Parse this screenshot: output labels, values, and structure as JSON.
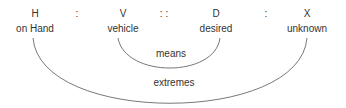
{
  "proportion": {
    "terms": [
      {
        "symbol": "H",
        "label": "on Hand",
        "x": 35
      },
      {
        "symbol": "V",
        "label": "vehicle",
        "x": 123
      },
      {
        "symbol": "D",
        "label": "desired",
        "x": 216
      },
      {
        "symbol": "X",
        "label": "unknown",
        "x": 307
      }
    ],
    "separators": [
      {
        "text": ":",
        "x": 77
      },
      {
        "text": ": :",
        "x": 164
      },
      {
        "text": ":",
        "x": 266
      }
    ]
  },
  "arcs": {
    "means": "means",
    "extremes": "extremes"
  }
}
